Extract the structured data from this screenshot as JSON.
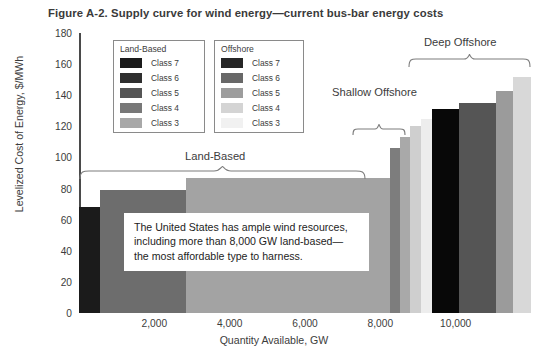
{
  "figure": {
    "title": "Figure A-2. Supply curve for wind energy—current bus-bar energy costs"
  },
  "callout": {
    "line1": "The United States has ample wind resources,",
    "line2": "including more than 8,000 GW land-based—",
    "line3": "the most affordable type to harness."
  },
  "annotations": [
    {
      "label": "Land-Based"
    },
    {
      "label": "Shallow Offshore"
    },
    {
      "label": "Deep Offshore"
    }
  ],
  "legends": [
    {
      "title": "Land-Based",
      "items": [
        {
          "label": "Class 7",
          "color": "#1b1b1b"
        },
        {
          "label": "Class 6",
          "color": "#2f2f2f"
        },
        {
          "label": "Class 5",
          "color": "#555555"
        },
        {
          "label": "Class 4",
          "color": "#787878"
        },
        {
          "label": "Class 3",
          "color": "#a8a8a8"
        }
      ]
    },
    {
      "title": "Offshore",
      "items": [
        {
          "label": "Class 7",
          "color": "#262626"
        },
        {
          "label": "Class 6",
          "color": "#686868"
        },
        {
          "label": "Class 5",
          "color": "#9d9d9d"
        },
        {
          "label": "Class 4",
          "color": "#d4d4d4"
        },
        {
          "label": "Class 3",
          "color": "#f1f1f1"
        }
      ]
    }
  ],
  "chart_data": {
    "type": "bar",
    "title": "Figure A-2. Supply curve for wind energy—current bus-bar energy costs",
    "xlabel": "Quantity Available, GW",
    "ylabel": "Levelized Cost of Energy, $/MWh",
    "xlim": [
      0,
      12000
    ],
    "ylim": [
      0,
      180
    ],
    "xticks": [
      "2,000",
      "4,000",
      "6,000",
      "8,000",
      "10,000"
    ],
    "xtick_values": [
      2000,
      4000,
      6000,
      8000,
      10000
    ],
    "yticks": [
      "0",
      "20",
      "40",
      "60",
      "80",
      "100",
      "120",
      "140",
      "160",
      "180"
    ],
    "ytick_values": [
      0,
      20,
      40,
      60,
      80,
      100,
      120,
      140,
      160,
      180
    ],
    "grid": false,
    "legend_position": "upper-left",
    "note": "Supply curve: bar width = resource quantity (GW), bar height = levelized cost of energy ($/MWh)",
    "bars": [
      {
        "group": "Land-Based",
        "class": "Class 7",
        "x_start": 0,
        "x_end": 550,
        "cost": 68,
        "color": "#1b1b1b"
      },
      {
        "group": "Land-Based",
        "class": "Class 6",
        "x_start": 550,
        "x_end": 2850,
        "cost": 79,
        "color": "#6d6d6d"
      },
      {
        "group": "Land-Based",
        "class": "Class 5",
        "x_start": 2850,
        "x_end": 8250,
        "cost": 87,
        "color": "#a3a3a3"
      },
      {
        "group": "Shallow Offshore",
        "class": "Class 7",
        "x_start": 8250,
        "x_end": 8520,
        "cost": 106,
        "color": "#7d7d7d"
      },
      {
        "group": "Shallow Offshore",
        "class": "Class 6",
        "x_start": 8520,
        "x_end": 8800,
        "cost": 113,
        "color": "#a9a9a9"
      },
      {
        "group": "Shallow Offshore",
        "class": "Class 5",
        "x_start": 8800,
        "x_end": 9080,
        "cost": 120,
        "color": "#cfcfcf"
      },
      {
        "group": "Shallow Offshore",
        "class": "Class 4",
        "x_start": 9080,
        "x_end": 9360,
        "cost": 125,
        "color": "#ededed"
      },
      {
        "group": "Deep Offshore",
        "class": "Class 7",
        "x_start": 9360,
        "x_end": 10080,
        "cost": 131,
        "color": "#080808"
      },
      {
        "group": "Deep Offshore",
        "class": "Class 6",
        "x_start": 10080,
        "x_end": 11080,
        "cost": 135,
        "color": "#555555"
      },
      {
        "group": "Deep Offshore",
        "class": "Class 5",
        "x_start": 11080,
        "x_end": 11520,
        "cost": 143,
        "color": "#9b9b9b"
      },
      {
        "group": "Deep Offshore",
        "class": "Class 4",
        "x_start": 11520,
        "x_end": 12000,
        "cost": 152,
        "color": "#d8d8d8"
      }
    ]
  }
}
